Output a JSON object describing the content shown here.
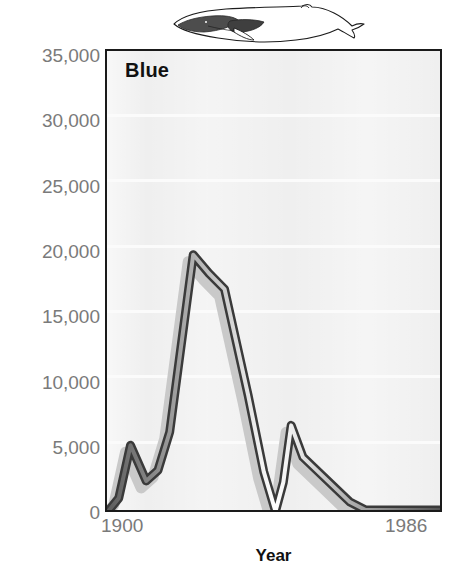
{
  "figure": {
    "panel_title": "Blue",
    "illustration": "blue-whale-illustration"
  },
  "chart_data": {
    "type": "line",
    "title": "Blue",
    "xlabel": "Year",
    "ylabel": "",
    "xlim": [
      1900,
      1986
    ],
    "ylim": [
      0,
      35000
    ],
    "grid": true,
    "legend": "none",
    "xtick_labels": [
      "1900",
      "1986"
    ],
    "ytick_labels": [
      "0",
      "5,000",
      "10,000",
      "15,000",
      "20,000",
      "25,000",
      "30,000",
      "35,000"
    ],
    "ytick_values": [
      0,
      5000,
      10000,
      15000,
      20000,
      25000,
      30000,
      35000
    ],
    "series": [
      {
        "name": "Blue whale catch",
        "color": "#6e6e6e",
        "x": [
          1900,
          1903,
          1906,
          1910,
          1913,
          1916,
          1922,
          1926,
          1930,
          1936,
          1940,
          1943,
          1945,
          1947,
          1950,
          1956,
          1962,
          1966,
          1972,
          1980,
          1986
        ],
        "values": [
          100,
          1200,
          5200,
          2500,
          3300,
          6200,
          19600,
          18200,
          17000,
          9000,
          3200,
          200,
          2400,
          6700,
          4300,
          2600,
          900,
          300,
          300,
          300,
          300
        ]
      }
    ],
    "annotations": [
      {
        "label": "peak",
        "x": 1922,
        "y": 19600
      },
      {
        "label": "secondary-peak",
        "x": 1947,
        "y": 6700
      }
    ]
  }
}
